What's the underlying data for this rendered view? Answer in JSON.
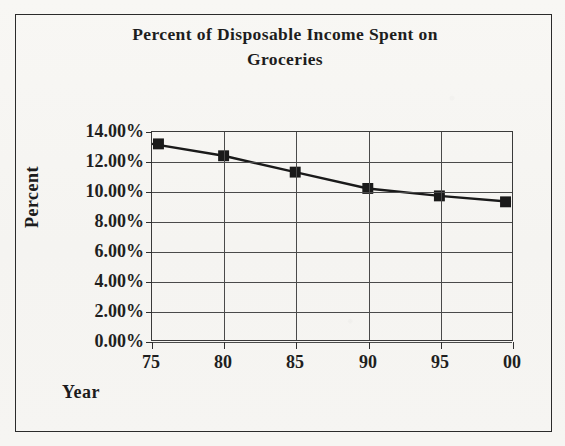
{
  "chart_data": {
    "type": "line",
    "title": "Percent of Disposable Income Spent on Groceries",
    "title_line1": "Percent of Disposable Income Spent on",
    "title_line2": "Groceries",
    "xlabel": "Year",
    "ylabel": "Percent",
    "categories": [
      "75",
      "80",
      "85",
      "90",
      "95",
      "00"
    ],
    "values": [
      13.2,
      12.4,
      11.3,
      10.2,
      9.7,
      9.3
    ],
    "series": [
      {
        "name": "Percent of Disposable Income Spent on Groceries",
        "values": [
          13.2,
          12.4,
          11.3,
          10.2,
          9.7,
          9.3
        ]
      }
    ],
    "ylim": [
      0,
      14
    ],
    "ytick_values": [
      14,
      12,
      10,
      8,
      6,
      4,
      2,
      0
    ],
    "ytick_labels": [
      "14.00%",
      "12.00%",
      "10.00%",
      "8.00%",
      "6.00%",
      "4.00%",
      "2.00%",
      "0.00%"
    ],
    "xtick_labels": [
      "75",
      "80",
      "85",
      "90",
      "95",
      "00"
    ],
    "grid": "both",
    "legend": "none",
    "marker": "square",
    "series_color": "#1a1a1a",
    "gridline_color": "#4a4a4a",
    "frame_color": "#2b2b2b",
    "background_color": "#f7f6f3"
  }
}
